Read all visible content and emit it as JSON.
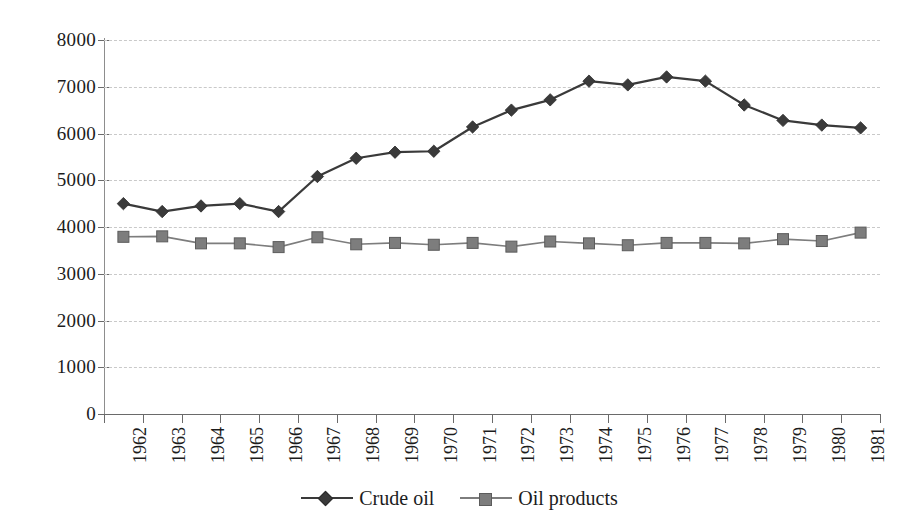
{
  "chart_data": {
    "type": "line",
    "title": "",
    "xlabel": "",
    "ylabel": "",
    "ylim": [
      0,
      8000
    ],
    "yticks": [
      0,
      1000,
      2000,
      3000,
      4000,
      5000,
      6000,
      7000,
      8000
    ],
    "ytick_labels": [
      "0",
      "1000",
      "2000",
      "3000",
      "4000",
      "5000",
      "6000",
      "7000",
      "8000"
    ],
    "grid": true,
    "legend_position": "bottom-center",
    "categories": [
      "1962",
      "1963",
      "1964",
      "1965",
      "1966",
      "1967",
      "1968",
      "1969",
      "1970",
      "1971",
      "1972",
      "1973",
      "1974",
      "1975",
      "1976",
      "1977",
      "1978",
      "1979",
      "1980",
      "1981"
    ],
    "series": [
      {
        "name": "Crude oil",
        "marker": "diamond",
        "color": "#3a3a3a",
        "values": [
          4500,
          4330,
          4450,
          4500,
          4330,
          5080,
          5470,
          5600,
          5620,
          6140,
          6500,
          6720,
          7120,
          7040,
          7210,
          7120,
          6610,
          6280,
          6180,
          6120
        ]
      },
      {
        "name": "Oil products",
        "marker": "square",
        "color": "#7d7d7d",
        "values": [
          3790,
          3800,
          3650,
          3650,
          3570,
          3780,
          3630,
          3660,
          3620,
          3660,
          3580,
          3690,
          3650,
          3610,
          3660,
          3660,
          3650,
          3740,
          3700,
          3880
        ]
      }
    ]
  },
  "legend": {
    "items": [
      {
        "label": "Crude oil"
      },
      {
        "label": "Oil products"
      }
    ]
  },
  "colors": {
    "crude_oil": "#3a3a3a",
    "oil_products": "#7d7d7d",
    "gridline": "#c9c9c9",
    "axis": "#6a6a6a",
    "background": "#ffffff"
  }
}
